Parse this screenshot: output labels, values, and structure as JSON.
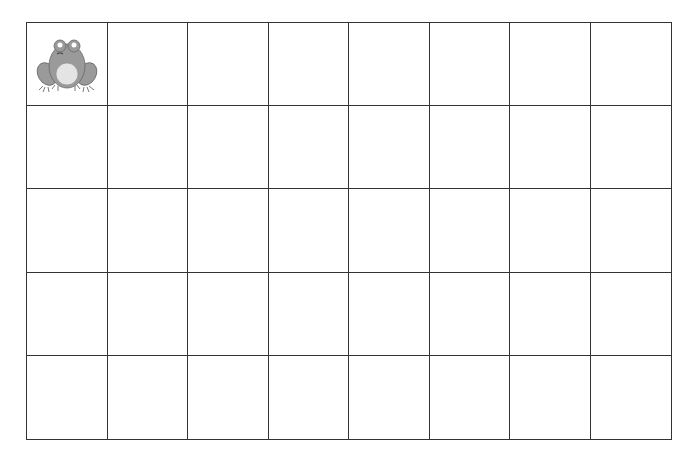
{
  "grid": {
    "rows": 5,
    "columns": 8,
    "line_color": "#333333",
    "cells_with_image": [
      {
        "row": 0,
        "col": 0,
        "image": "frog-icon"
      }
    ]
  }
}
